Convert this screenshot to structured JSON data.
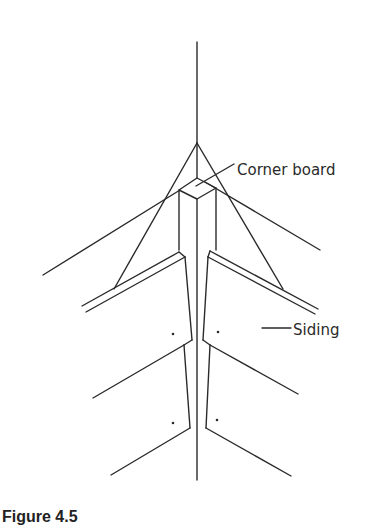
{
  "figure": {
    "labels": {
      "corner_board": "Corner board",
      "siding": "Siding"
    },
    "caption": "Figure 4.5"
  },
  "colors": {
    "line": "#2a2a2a",
    "background": "#ffffff"
  }
}
